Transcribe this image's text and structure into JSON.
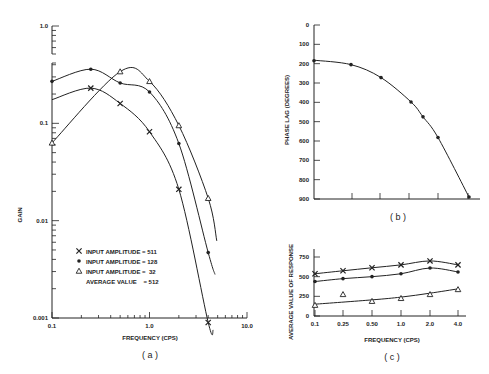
{
  "chart_data": [
    {
      "id": "a",
      "type": "line",
      "caption": "(a)",
      "xlabel": "FREQUENCY (CPS)",
      "ylabel": "GAIN",
      "xscale": "log",
      "yscale": "log",
      "xlim": [
        0.1,
        10.0
      ],
      "ylim": [
        0.001,
        1.0
      ],
      "x_tick_labels": [
        "0.1",
        "1.0",
        "10.0"
      ],
      "y_tick_labels": [
        "0.001",
        "0.01",
        "0.1",
        "1.0"
      ],
      "legend": [
        {
          "marker": "x",
          "label": "INPUT AMPLITUDE = 511"
        },
        {
          "marker": "dot",
          "label": "INPUT AMPLITUDE = 128"
        },
        {
          "marker": "triangle",
          "label": "INPUT AMPLITUDE =  32"
        },
        {
          "marker": "none",
          "label": "AVERAGE VALUE    = 512"
        }
      ],
      "series": [
        {
          "name": "INPUT AMPLITUDE = 511",
          "marker": "x",
          "x": [
            0.25,
            0.5,
            1.0,
            2.0,
            4.0
          ],
          "y": [
            0.23,
            0.16,
            0.082,
            0.021,
            0.0009
          ]
        },
        {
          "name": "INPUT AMPLITUDE = 128",
          "marker": "dot",
          "x": [
            0.1,
            0.25,
            0.5,
            1.0,
            2.0,
            4.0
          ],
          "y": [
            0.27,
            0.36,
            0.26,
            0.21,
            0.062,
            0.0047
          ]
        },
        {
          "name": "INPUT AMPLITUDE = 32",
          "marker": "triangle",
          "x": [
            0.1,
            0.5,
            1.0,
            2.0,
            4.0
          ],
          "y": [
            0.063,
            0.34,
            0.27,
            0.095,
            0.017
          ]
        }
      ]
    },
    {
      "id": "b",
      "type": "line",
      "caption": "(b)",
      "xlabel": "",
      "ylabel": "PHASE LAG (DEGREES)",
      "ylim": [
        0,
        900
      ],
      "y_inverted": true,
      "y_tick_labels": [
        "0",
        "100",
        "200",
        "300",
        "400",
        "500",
        "600",
        "700",
        "800",
        "900"
      ],
      "x": [
        0.1,
        0.25,
        0.5,
        1.0,
        1.5,
        2.0,
        4.0
      ],
      "series": [
        {
          "name": "phase lag",
          "marker": "dot",
          "values": [
            185,
            205,
            272,
            398,
            475,
            582,
            890
          ]
        }
      ]
    },
    {
      "id": "c",
      "type": "line",
      "caption": "(c)",
      "xlabel": "FREQUENCY (CPS)",
      "ylabel": "AVERAGE VALUE OF RESPONSE",
      "ylim": [
        0,
        750
      ],
      "y_tick_labels": [
        "0",
        "250",
        "500",
        "750"
      ],
      "categories": [
        "0.1",
        "0.25",
        "0.50",
        "1.0",
        "2.0",
        "4.0"
      ],
      "series": [
        {
          "name": "INPUT AMPLITUDE = 511",
          "marker": "x",
          "values": [
            537,
            575,
            613,
            650,
            700,
            650
          ]
        },
        {
          "name": "INPUT AMPLITUDE = 128",
          "marker": "dot",
          "values": [
            438,
            475,
            500,
            537,
            610,
            560
          ]
        },
        {
          "name": "INPUT AMPLITUDE = 32",
          "marker": "triangle",
          "values": [
            138,
            275,
            188,
            225,
            275,
            338
          ]
        }
      ]
    }
  ],
  "labels": {
    "a_caption": "( a )",
    "b_caption": "( b )",
    "c_caption": "( c )",
    "a_xlabel": "FREQUENCY (CPS)",
    "a_ylabel": "GAIN",
    "b_ylabel": "PHASE LAG (DEGREES)",
    "c_xlabel": "FREQUENCY (CPS)",
    "c_ylabel": "AVERAGE VALUE OF RESPONSE",
    "legend_1": "INPUT AMPLITUDE = 511",
    "legend_2": "INPUT AMPLITUDE = 128",
    "legend_3": "INPUT AMPLITUDE =  32",
    "legend_4": "AVERAGE VALUE    = 512"
  }
}
